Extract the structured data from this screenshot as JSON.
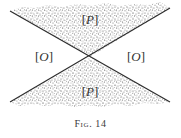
{
  "figure": {
    "caption": "Fig. 14",
    "colors": {
      "background": "#ffffff",
      "line": "#2b2b2b",
      "stipple": "#5a5a5a",
      "text": "#333333"
    },
    "lines": [
      {
        "name": "descending-line",
        "x1": 10,
        "y1": 11,
        "x2": 170,
        "y2": 102
      },
      {
        "name": "ascending-line",
        "x1": 10,
        "y1": 102,
        "x2": 170,
        "y2": 8
      }
    ],
    "intersection": {
      "x": 90,
      "y": 57
    },
    "regions": [
      {
        "id": "top",
        "label": "P",
        "shaded": true,
        "label_x": 90,
        "label_y": 20
      },
      {
        "id": "left",
        "label": "O",
        "shaded": false,
        "label_x": 44,
        "label_y": 57
      },
      {
        "id": "right",
        "label": "O",
        "shaded": false,
        "label_x": 136,
        "label_y": 57
      },
      {
        "id": "bottom",
        "label": "P",
        "shaded": true,
        "label_x": 90,
        "label_y": 92
      }
    ]
  }
}
